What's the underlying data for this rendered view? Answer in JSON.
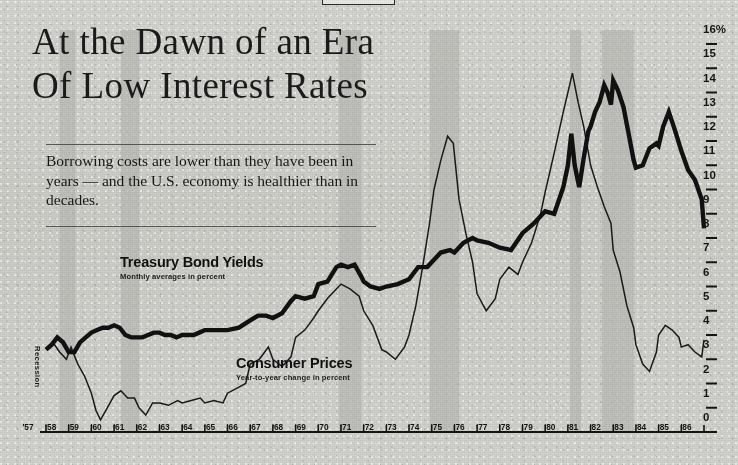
{
  "headline": {
    "line1": "At the Dawn of an Era",
    "line2": "Of Low Interest Rates"
  },
  "deck": "Borrowing costs are lower than they have been in years — and the U.S. economy is healthier than in decades.",
  "annotations": {
    "recession_label": "Recession"
  },
  "colors": {
    "ink": "#141414",
    "paper": "#d2d2ce",
    "recession_band": "#b9b9b4",
    "bond_line": "#111111",
    "cpi_line": "#1a1a1a"
  },
  "chart_data": {
    "type": "line",
    "title": "At the Dawn of an Era Of Low Interest Rates",
    "subtitle": "Borrowing costs are lower than they have been in years — and the U.S. economy is healthier than in decades.",
    "xlabel": "",
    "ylabel": "",
    "ylim": [
      0,
      16
    ],
    "xlim": [
      1957,
      1986
    ],
    "grid": false,
    "legend_position": "inline-annotations",
    "y_ticks": [
      0,
      1,
      2,
      3,
      4,
      5,
      6,
      7,
      8,
      9,
      10,
      11,
      12,
      13,
      14,
      15,
      16
    ],
    "y_tick_labels": [
      "0",
      "1",
      "2",
      "3",
      "4",
      "5",
      "6",
      "7",
      "8",
      "9",
      "10",
      "11",
      "12",
      "13",
      "14",
      "15",
      "16%"
    ],
    "x_ticks": [
      1957,
      1958,
      1959,
      1960,
      1961,
      1962,
      1963,
      1964,
      1965,
      1966,
      1967,
      1968,
      1969,
      1970,
      1971,
      1972,
      1973,
      1974,
      1975,
      1976,
      1977,
      1978,
      1979,
      1980,
      1981,
      1982,
      1983,
      1984,
      1985,
      1986
    ],
    "x_tick_labels": [
      "'57",
      "'58",
      "'59",
      "'60",
      "'61",
      "'62",
      "'63",
      "'64",
      "'65",
      "'66",
      "'67",
      "'68",
      "'69",
      "'70",
      "'71",
      "'72",
      "'73",
      "'74",
      "'75",
      "'76",
      "'77",
      "'78",
      "'79",
      "'80",
      "'81",
      "'82",
      "'83",
      "'84",
      "'85",
      "'86"
    ],
    "recession_bands": [
      {
        "start": 1957.6,
        "end": 1958.3
      },
      {
        "start": 1960.3,
        "end": 1961.1
      },
      {
        "start": 1969.9,
        "end": 1970.9
      },
      {
        "start": 1973.9,
        "end": 1975.2
      },
      {
        "start": 1980.1,
        "end": 1980.6
      },
      {
        "start": 1981.5,
        "end": 1982.9
      }
    ],
    "series": [
      {
        "name": "Treasury Bond Yields",
        "note": "Monthly averages in percent",
        "style": "thick",
        "x": [
          1957.0,
          1957.25,
          1957.5,
          1957.75,
          1958.0,
          1958.25,
          1958.5,
          1958.75,
          1959.0,
          1959.25,
          1959.5,
          1959.75,
          1960.0,
          1960.25,
          1960.5,
          1960.75,
          1961.0,
          1961.25,
          1961.5,
          1961.75,
          1962.0,
          1962.25,
          1962.5,
          1962.75,
          1963.0,
          1963.25,
          1963.5,
          1963.75,
          1964.0,
          1964.5,
          1965.0,
          1965.5,
          1966.0,
          1966.35,
          1966.7,
          1967.0,
          1967.4,
          1967.8,
          1968.0,
          1968.4,
          1968.8,
          1969.0,
          1969.4,
          1969.8,
          1970.0,
          1970.3,
          1970.6,
          1970.9,
          1971.0,
          1971.3,
          1971.7,
          1972.0,
          1972.5,
          1973.0,
          1973.4,
          1973.8,
          1974.0,
          1974.4,
          1974.8,
          1975.0,
          1975.4,
          1975.8,
          1976.0,
          1976.5,
          1977.0,
          1977.5,
          1978.0,
          1978.5,
          1979.0,
          1979.4,
          1979.8,
          1980.0,
          1980.15,
          1980.3,
          1980.5,
          1980.7,
          1980.9,
          1981.0,
          1981.2,
          1981.4,
          1981.6,
          1981.75,
          1981.9,
          1982.0,
          1982.2,
          1982.45,
          1982.7,
          1982.9,
          1983.0,
          1983.3,
          1983.6,
          1983.9,
          1984.0,
          1984.2,
          1984.45,
          1984.7,
          1984.9,
          1985.0,
          1985.3,
          1985.6,
          1985.9,
          1986.0
        ],
        "y": [
          3.4,
          3.6,
          3.9,
          3.7,
          3.3,
          3.3,
          3.7,
          3.9,
          4.1,
          4.2,
          4.3,
          4.3,
          4.4,
          4.3,
          4.0,
          3.9,
          3.9,
          3.9,
          4.0,
          4.1,
          4.1,
          4.0,
          4.0,
          3.9,
          4.0,
          4.0,
          4.0,
          4.1,
          4.2,
          4.2,
          4.2,
          4.3,
          4.6,
          4.8,
          4.8,
          4.7,
          4.9,
          5.4,
          5.6,
          5.5,
          5.6,
          6.1,
          6.2,
          6.8,
          6.9,
          6.8,
          6.9,
          6.4,
          6.2,
          6.0,
          5.9,
          6.0,
          6.1,
          6.3,
          6.8,
          6.8,
          7.0,
          7.4,
          7.5,
          7.4,
          7.8,
          8.0,
          7.9,
          7.8,
          7.6,
          7.5,
          8.2,
          8.6,
          9.1,
          9.0,
          10.1,
          11.0,
          12.3,
          11.0,
          10.1,
          11.3,
          12.4,
          12.6,
          13.2,
          13.6,
          14.3,
          14.0,
          13.5,
          14.5,
          14.1,
          13.4,
          12.2,
          11.2,
          10.9,
          11.0,
          11.7,
          11.9,
          11.8,
          12.6,
          13.2,
          12.5,
          11.9,
          11.6,
          10.8,
          10.4,
          9.6,
          8.4
        ]
      },
      {
        "name": "Consumer Prices",
        "note": "Year-to-year change in percent",
        "style": "thin",
        "x": [
          1957.0,
          1957.3,
          1957.6,
          1957.9,
          1958.1,
          1958.4,
          1958.7,
          1959.0,
          1959.2,
          1959.4,
          1959.7,
          1960.0,
          1960.3,
          1960.6,
          1960.9,
          1961.1,
          1961.4,
          1961.7,
          1962.0,
          1962.4,
          1962.8,
          1963.0,
          1963.4,
          1963.8,
          1964.0,
          1964.4,
          1964.8,
          1965.0,
          1965.4,
          1965.8,
          1966.0,
          1966.4,
          1966.8,
          1967.0,
          1967.4,
          1967.8,
          1968.0,
          1968.4,
          1968.8,
          1969.0,
          1969.4,
          1969.8,
          1970.0,
          1970.4,
          1970.8,
          1971.0,
          1971.4,
          1971.8,
          1972.0,
          1972.4,
          1972.8,
          1973.0,
          1973.3,
          1973.6,
          1973.9,
          1974.1,
          1974.4,
          1974.7,
          1974.95,
          1975.2,
          1975.5,
          1975.8,
          1976.0,
          1976.4,
          1976.8,
          1977.0,
          1977.4,
          1977.8,
          1978.0,
          1978.4,
          1978.8,
          1979.0,
          1979.4,
          1979.8,
          1980.0,
          1980.2,
          1980.45,
          1980.7,
          1981.0,
          1981.3,
          1981.6,
          1981.9,
          1982.0,
          1982.3,
          1982.6,
          1982.9,
          1983.0,
          1983.3,
          1983.6,
          1983.9,
          1984.0,
          1984.3,
          1984.6,
          1984.9,
          1985.0,
          1985.3,
          1985.6,
          1985.9,
          1986.0
        ],
        "y": [
          3.4,
          3.7,
          3.3,
          3.0,
          3.5,
          2.8,
          2.3,
          1.6,
          0.9,
          0.5,
          1.0,
          1.5,
          1.7,
          1.4,
          1.4,
          1.0,
          0.7,
          1.2,
          1.2,
          1.1,
          1.3,
          1.2,
          1.3,
          1.4,
          1.2,
          1.3,
          1.2,
          1.6,
          1.8,
          2.0,
          2.8,
          3.0,
          3.5,
          3.0,
          2.7,
          3.1,
          3.9,
          4.2,
          4.7,
          5.0,
          5.5,
          5.9,
          6.1,
          5.9,
          5.6,
          5.0,
          4.4,
          3.4,
          3.3,
          3.0,
          3.5,
          4.0,
          5.2,
          6.8,
          8.6,
          10.0,
          11.2,
          12.2,
          11.9,
          9.6,
          8.2,
          7.0,
          5.7,
          5.0,
          5.5,
          6.3,
          6.8,
          6.5,
          7.0,
          7.8,
          9.0,
          9.9,
          11.5,
          13.2,
          14.0,
          14.8,
          13.6,
          12.6,
          11.0,
          10.1,
          9.3,
          8.6,
          7.5,
          6.6,
          5.2,
          4.3,
          3.6,
          2.8,
          2.5,
          3.3,
          4.0,
          4.4,
          4.2,
          3.9,
          3.5,
          3.6,
          3.3,
          3.1,
          3.8
        ]
      }
    ]
  }
}
